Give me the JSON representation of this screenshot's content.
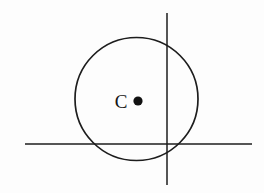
{
  "figure": {
    "background_color": "#fdfdfd",
    "stroke_color": "#1d1d1d",
    "label_color": "#151515",
    "width": 264,
    "height": 193
  },
  "labels": {
    "center_point": "C"
  },
  "chart_data": {
    "type": "diagram",
    "xlabel": "",
    "ylabel": "",
    "xlim": [
      0,
      264
    ],
    "ylim": [
      0,
      193
    ],
    "grid": false,
    "legend": "none",
    "shapes": [
      {
        "name": "circle",
        "kind": "circle",
        "cx": 136.5,
        "cy": 99,
        "r": 61.5,
        "stroke_width": 1.7,
        "fill": "none"
      },
      {
        "name": "vertical-line",
        "kind": "line",
        "x1": 167,
        "y1": 13,
        "x2": 167,
        "y2": 185,
        "stroke_width": 1.5
      },
      {
        "name": "horizontal-line",
        "kind": "line",
        "x1": 25,
        "y1": 144,
        "x2": 252,
        "y2": 144,
        "stroke_width": 1.5
      },
      {
        "name": "center-dot",
        "kind": "point",
        "cx": 138,
        "cy": 101,
        "r": 4.6,
        "fill": "#111111"
      }
    ],
    "annotations": [
      {
        "name": "center-label",
        "text": "C",
        "x": 121,
        "y": 108,
        "font_size": 19
      }
    ]
  }
}
